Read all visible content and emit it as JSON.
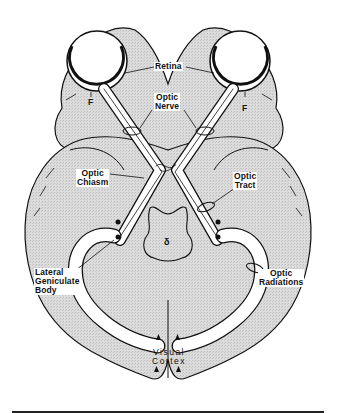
{
  "figure": {
    "labels": {
      "retina": "Retina",
      "optic_nerve": "Optic\nNerve",
      "fovea_left": "F",
      "fovea_right": "F",
      "optic_chiasm": "Optic\nChiasm",
      "optic_tract": "Optic\nTract",
      "lateral_geniculate_body": "Lateral\nGeniculate\nBody",
      "optic_radiations": "Optic\nRadiations",
      "visual_cortex": "Visual\nCortex",
      "brainstem_marker": "δ"
    },
    "colors": {
      "brain_fill": "#d9d9d9",
      "outline": "#111111",
      "background": "#ffffff"
    }
  }
}
